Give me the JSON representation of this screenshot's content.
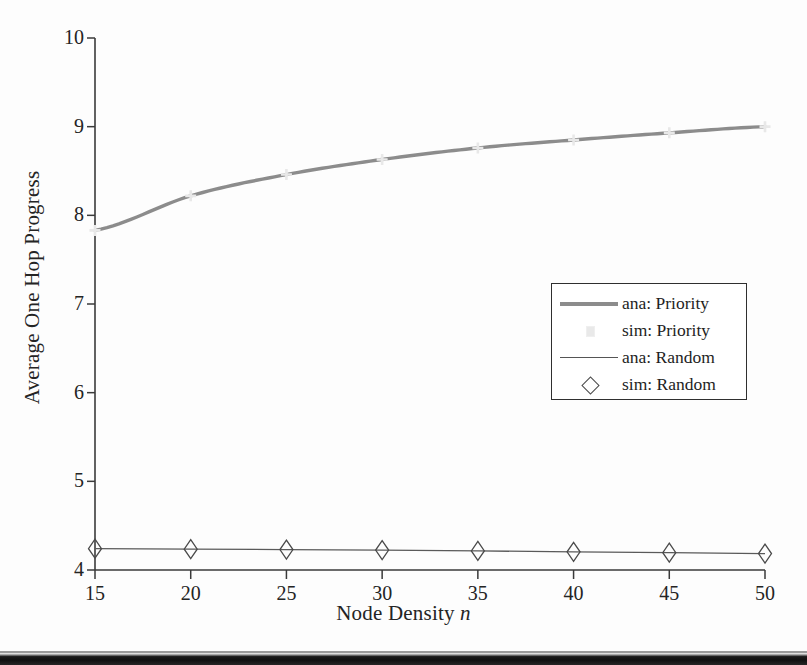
{
  "figure": {
    "background_color": "#fdfdfd",
    "axis_color": "#3a3a3a"
  },
  "chart_data": {
    "type": "line",
    "title": "",
    "xlabel": "Node Density n",
    "xlabel_plain": "Node Density",
    "xlabel_italic": "n",
    "ylabel": "Average One Hop Progress",
    "x": [
      15,
      20,
      25,
      30,
      35,
      40,
      45,
      50
    ],
    "xlim": [
      15,
      50
    ],
    "ylim": [
      4,
      10
    ],
    "xticks": [
      15,
      20,
      25,
      30,
      35,
      40,
      45,
      50
    ],
    "yticks": [
      4,
      5,
      6,
      7,
      8,
      9,
      10
    ],
    "xtick_labels": [
      "15",
      "20",
      "25",
      "30",
      "35",
      "40",
      "45",
      "50"
    ],
    "ytick_labels": [
      "4",
      "5",
      "6",
      "7",
      "8",
      "9",
      "10"
    ],
    "grid": false,
    "legend_position": "center-right",
    "series": [
      {
        "name": "ana: Priority",
        "style": "line",
        "color": "#8c8c8c",
        "linewidth": 3.4,
        "values": [
          7.83,
          8.22,
          8.46,
          8.63,
          8.76,
          8.85,
          8.93,
          9.0
        ]
      },
      {
        "name": "sim: Priority",
        "style": "marker",
        "marker": "point",
        "color": "#e8e8e8",
        "values": [
          7.83,
          8.22,
          8.46,
          8.63,
          8.76,
          8.85,
          8.93,
          9.0
        ]
      },
      {
        "name": "ana: Random",
        "style": "line",
        "color": "#5a5a5a",
        "linewidth": 1.3,
        "values": [
          4.24,
          4.235,
          4.23,
          4.225,
          4.215,
          4.205,
          4.195,
          4.185
        ]
      },
      {
        "name": "sim: Random",
        "style": "marker",
        "marker": "diamond",
        "color": "#4a4a4a",
        "values": [
          4.24,
          4.235,
          4.23,
          4.225,
          4.215,
          4.205,
          4.195,
          4.185
        ]
      }
    ]
  },
  "legend": {
    "entries": [
      {
        "label": "ana: Priority",
        "key": "thick-line-key",
        "color": "#8c8c8c"
      },
      {
        "label": "sim: Priority",
        "key": "faint-dot-key",
        "color": "#e9e9e9"
      },
      {
        "label": "ana: Random",
        "key": "thin-line-key",
        "color": "#555555"
      },
      {
        "label": "sim: Random",
        "key": "diamond-marker-key",
        "color": "#4a4a4a"
      }
    ]
  }
}
